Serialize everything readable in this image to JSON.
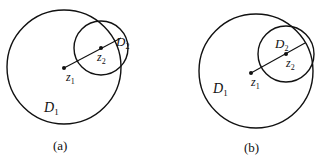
{
  "figure": {
    "panels": [
      {
        "caption": "(a)",
        "big_circle_label": "D",
        "big_circle_sub": "1",
        "small_circle_label": "D",
        "small_circle_sub": "2",
        "center1_label": "z",
        "center1_sub": "1",
        "center2_label": "z",
        "center2_sub": "2"
      },
      {
        "caption": "(b)",
        "big_circle_label": "D",
        "big_circle_sub": "1",
        "small_circle_label": "D",
        "small_circle_sub": "2",
        "center1_label": "z",
        "center1_sub": "1",
        "center2_label": "z",
        "center2_sub": "2"
      }
    ],
    "stroke_color": "#111111",
    "background": "#ffffff"
  }
}
